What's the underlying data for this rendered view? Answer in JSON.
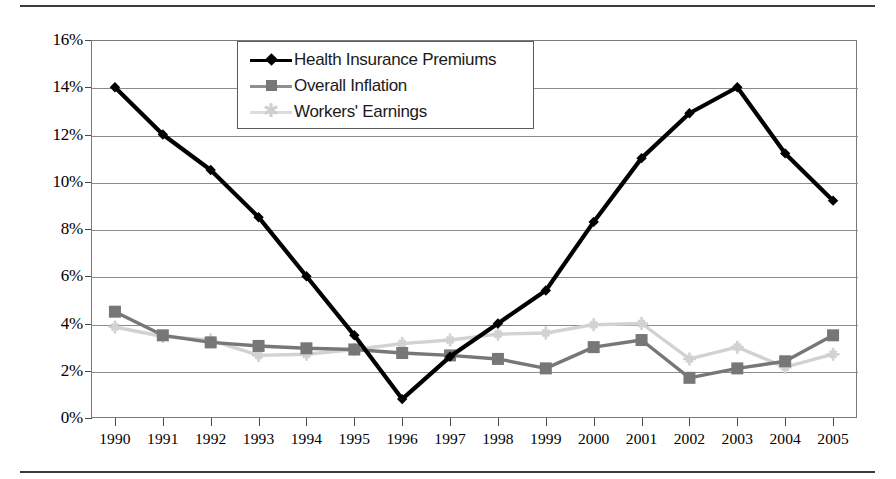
{
  "chart_data": {
    "type": "line",
    "title": "",
    "xlabel": "",
    "ylabel": "",
    "categories": [
      "1990",
      "1991",
      "1992",
      "1993",
      "1994",
      "1995",
      "1996",
      "1997",
      "1998",
      "1999",
      "2000",
      "2001",
      "2002",
      "2003",
      "2004",
      "2005"
    ],
    "ylim": [
      0,
      16
    ],
    "ytick_labels": [
      "0%",
      "2%",
      "4%",
      "6%",
      "8%",
      "10%",
      "12%",
      "14%",
      "16%"
    ],
    "ytick_values": [
      0,
      2,
      4,
      6,
      8,
      10,
      12,
      14,
      16
    ],
    "grid": true,
    "legend_position": "top-center",
    "series": [
      {
        "name": "Health Insurance Premiums",
        "color": "#000000",
        "marker": "diamond",
        "values": [
          14.0,
          12.0,
          10.5,
          8.5,
          6.0,
          3.5,
          0.8,
          2.6,
          4.0,
          5.4,
          8.3,
          11.0,
          12.9,
          14.0,
          11.2,
          9.2
        ]
      },
      {
        "name": "Overall Inflation",
        "color": "#777777",
        "marker": "square",
        "values": [
          4.5,
          3.5,
          3.2,
          3.05,
          2.95,
          2.9,
          2.75,
          2.65,
          2.5,
          2.1,
          3.0,
          3.3,
          1.7,
          2.1,
          2.4,
          3.5
        ]
      },
      {
        "name": "Workers' Earnings",
        "color": "#d2d2d2",
        "marker": "star",
        "values": [
          3.85,
          3.45,
          3.3,
          2.65,
          2.7,
          2.9,
          3.15,
          3.3,
          3.55,
          3.6,
          3.95,
          4.0,
          2.5,
          3.0,
          2.15,
          2.7
        ]
      }
    ]
  },
  "legend": {
    "items": [
      {
        "label": "Health Insurance Premiums",
        "marker": "diamond-marker-icon"
      },
      {
        "label": "Overall Inflation",
        "marker": "square-marker-icon"
      },
      {
        "label": "Workers' Earnings",
        "marker": "star-marker-icon"
      }
    ]
  }
}
